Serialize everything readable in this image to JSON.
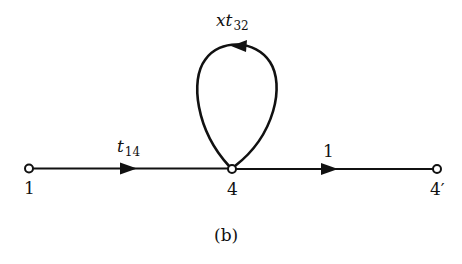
{
  "diagram": {
    "type": "signal-flow-graph",
    "caption": "(b)",
    "nodes": [
      {
        "id": "n1",
        "label": "1",
        "x": 29,
        "y": 168
      },
      {
        "id": "n4",
        "label": "4",
        "x": 232,
        "y": 169
      },
      {
        "id": "n4p",
        "label": "4′",
        "x": 437,
        "y": 169
      }
    ],
    "edges": [
      {
        "from": "1",
        "to": "4",
        "gain_var": "t",
        "gain_sub": "14"
      },
      {
        "from": "4",
        "to": "4",
        "kind": "self-loop",
        "gain_coef": "x",
        "gain_var": "t",
        "gain_sub": "32"
      },
      {
        "from": "4",
        "to": "4′",
        "gain": "1"
      }
    ],
    "colors": {
      "line": "#111111",
      "background": "#ffffff"
    }
  }
}
